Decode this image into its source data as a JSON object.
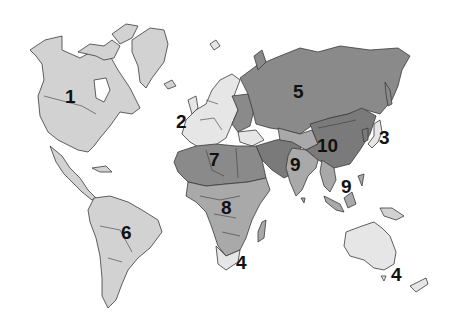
{
  "map": {
    "type": "world-region-map",
    "colors": {
      "light": "#d2d2d2",
      "lightest": "#e6e6e6",
      "medium": "#a9a9a9",
      "dark": "#8a8a8a",
      "darker": "#7a7a7a",
      "outline": "#3a3a3a"
    },
    "regions": [
      {
        "id": 1,
        "label": "1",
        "area": "North America"
      },
      {
        "id": 2,
        "label": "2",
        "area": "Western Europe"
      },
      {
        "id": 3,
        "label": "3",
        "area": "Japan"
      },
      {
        "id": 4,
        "label": "4",
        "area": "South Africa"
      },
      {
        "id": 4,
        "label": "4",
        "area": "Australia / New Zealand"
      },
      {
        "id": 5,
        "label": "5",
        "area": "Russia / Eastern Europe"
      },
      {
        "id": 6,
        "label": "6",
        "area": "Latin America"
      },
      {
        "id": 7,
        "label": "7",
        "area": "North Africa / Middle East"
      },
      {
        "id": 8,
        "label": "8",
        "area": "Sub-Saharan Africa"
      },
      {
        "id": 9,
        "label": "9",
        "area": "South Asia"
      },
      {
        "id": 9,
        "label": "9",
        "area": "Southeast Asia"
      },
      {
        "id": 10,
        "label": "10",
        "area": "China"
      }
    ]
  }
}
